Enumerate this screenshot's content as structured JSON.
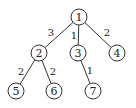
{
  "diagram": {
    "type": "weighted-tree",
    "nodes": [
      {
        "id": "1",
        "label": "1",
        "x": 79,
        "y": 17
      },
      {
        "id": "2",
        "label": "2",
        "x": 39,
        "y": 53
      },
      {
        "id": "3",
        "label": "3",
        "x": 78,
        "y": 53
      },
      {
        "id": "4",
        "label": "4",
        "x": 117,
        "y": 53
      },
      {
        "id": "5",
        "label": "5",
        "x": 16,
        "y": 91
      },
      {
        "id": "6",
        "label": "6",
        "x": 54,
        "y": 91
      },
      {
        "id": "7",
        "label": "7",
        "x": 93,
        "y": 91
      }
    ],
    "edges": [
      {
        "from": "1",
        "to": "2",
        "weight": "3",
        "lx": 51,
        "ly": 32
      },
      {
        "from": "1",
        "to": "3",
        "weight": "1",
        "lx": 74,
        "ly": 35
      },
      {
        "from": "1",
        "to": "4",
        "weight": "2",
        "lx": 107,
        "ly": 32
      },
      {
        "from": "2",
        "to": "5",
        "weight": "2",
        "lx": 21,
        "ly": 71
      },
      {
        "from": "2",
        "to": "6",
        "weight": "2",
        "lx": 53,
        "ly": 71
      },
      {
        "from": "3",
        "to": "7",
        "weight": "1",
        "lx": 90,
        "ly": 70
      }
    ],
    "node_radius": 8
  }
}
